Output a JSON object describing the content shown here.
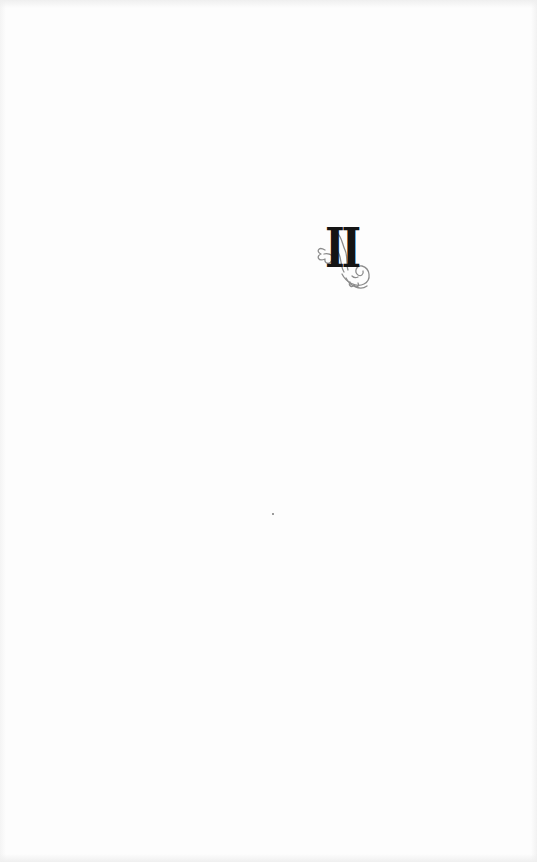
{
  "page": {
    "chapter_numeral": "II",
    "ornament": "floral-flourish",
    "colors": {
      "paper": "#fdfdfd",
      "numeral": "#141414",
      "ornament": "#8c8c8c"
    }
  }
}
